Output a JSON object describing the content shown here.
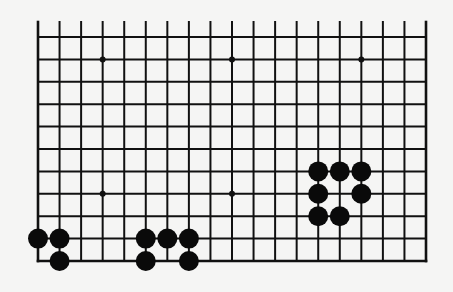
{
  "diagram": {
    "type": "go-board-fragment",
    "canvas": {
      "width": 453,
      "height": 292,
      "background": "#f5f5f4"
    },
    "grid": {
      "columns": 19,
      "rows": 11,
      "x_start": 38,
      "x_end": 426,
      "y_start": 37,
      "y_end": 261,
      "open_top_extension_y": 22,
      "line_color": "#111111",
      "line_width": 2,
      "edge_width": 2.6,
      "edges": {
        "top": false,
        "bottom": true,
        "left": true,
        "right": true
      }
    },
    "star_points": [
      {
        "col": 3,
        "row": 1
      },
      {
        "col": 9,
        "row": 1
      },
      {
        "col": 15,
        "row": 1
      },
      {
        "col": 3,
        "row": 7
      },
      {
        "col": 9,
        "row": 7
      }
    ],
    "star_point_radius": 3,
    "stone_radius": 10,
    "stone_color": "#0a0a0a",
    "stones": [
      {
        "color": "black",
        "col": 0,
        "row": 9,
        "group": "bottom-left"
      },
      {
        "color": "black",
        "col": 1,
        "row": 9,
        "group": "bottom-left"
      },
      {
        "color": "black",
        "col": 1,
        "row": 10,
        "group": "bottom-left"
      },
      {
        "color": "black",
        "col": 5,
        "row": 9,
        "group": "bottom-middle"
      },
      {
        "color": "black",
        "col": 6,
        "row": 9,
        "group": "bottom-middle"
      },
      {
        "color": "black",
        "col": 7,
        "row": 9,
        "group": "bottom-middle"
      },
      {
        "color": "black",
        "col": 5,
        "row": 10,
        "group": "bottom-middle"
      },
      {
        "color": "black",
        "col": 7,
        "row": 10,
        "group": "bottom-middle"
      },
      {
        "color": "black",
        "col": 13,
        "row": 6,
        "group": "right"
      },
      {
        "color": "black",
        "col": 14,
        "row": 6,
        "group": "right"
      },
      {
        "color": "black",
        "col": 15,
        "row": 6,
        "group": "right"
      },
      {
        "color": "black",
        "col": 13,
        "row": 7,
        "group": "right"
      },
      {
        "color": "black",
        "col": 15,
        "row": 7,
        "group": "right"
      },
      {
        "color": "black",
        "col": 13,
        "row": 8,
        "group": "right"
      },
      {
        "color": "black",
        "col": 14,
        "row": 8,
        "group": "right"
      }
    ]
  }
}
